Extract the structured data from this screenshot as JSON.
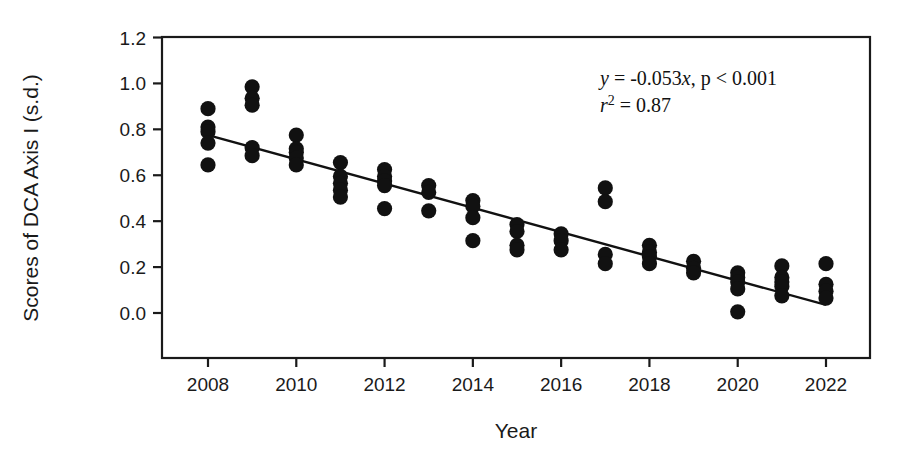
{
  "chart_data": {
    "type": "scatter",
    "title": "",
    "xlabel": "Year",
    "ylabel": "Scores of DCA Axis I (s.d.)",
    "xlim": [
      2007.0,
      2023.0
    ],
    "ylim": [
      -0.1,
      1.25
    ],
    "xticks": [
      2008,
      2010,
      2012,
      2014,
      2016,
      2018,
      2020,
      2022
    ],
    "xtick_labels": [
      "2008",
      "2010",
      "2012",
      "2014",
      "2016",
      "2018",
      "2020",
      "2022"
    ],
    "yticks": [
      0.0,
      0.2,
      0.4,
      0.6,
      0.8,
      1.0,
      1.2
    ],
    "ytick_labels": [
      "0.0",
      "0.2",
      "0.4",
      "0.6",
      "0.8",
      "1.0",
      "1.2"
    ],
    "grid": false,
    "legend": "none",
    "marker": "filled-circle",
    "marker_color": "#111111",
    "points": [
      {
        "x": 2008,
        "y": 0.89
      },
      {
        "x": 2008,
        "y": 0.81
      },
      {
        "x": 2008,
        "y": 0.79
      },
      {
        "x": 2008,
        "y": 0.74
      },
      {
        "x": 2008,
        "y": 0.645
      },
      {
        "x": 2009,
        "y": 0.985
      },
      {
        "x": 2009,
        "y": 0.935
      },
      {
        "x": 2009,
        "y": 0.905
      },
      {
        "x": 2009,
        "y": 0.72
      },
      {
        "x": 2009,
        "y": 0.685
      },
      {
        "x": 2010,
        "y": 0.775
      },
      {
        "x": 2010,
        "y": 0.715
      },
      {
        "x": 2010,
        "y": 0.7
      },
      {
        "x": 2010,
        "y": 0.675
      },
      {
        "x": 2010,
        "y": 0.645
      },
      {
        "x": 2011,
        "y": 0.655
      },
      {
        "x": 2011,
        "y": 0.595
      },
      {
        "x": 2011,
        "y": 0.565
      },
      {
        "x": 2011,
        "y": 0.535
      },
      {
        "x": 2011,
        "y": 0.505
      },
      {
        "x": 2012,
        "y": 0.625
      },
      {
        "x": 2012,
        "y": 0.595
      },
      {
        "x": 2012,
        "y": 0.575
      },
      {
        "x": 2012,
        "y": 0.555
      },
      {
        "x": 2012,
        "y": 0.455
      },
      {
        "x": 2013,
        "y": 0.555
      },
      {
        "x": 2013,
        "y": 0.525
      },
      {
        "x": 2013,
        "y": 0.445
      },
      {
        "x": 2014,
        "y": 0.49
      },
      {
        "x": 2014,
        "y": 0.465
      },
      {
        "x": 2014,
        "y": 0.415
      },
      {
        "x": 2014,
        "y": 0.315
      },
      {
        "x": 2015,
        "y": 0.385
      },
      {
        "x": 2015,
        "y": 0.355
      },
      {
        "x": 2015,
        "y": 0.295
      },
      {
        "x": 2015,
        "y": 0.275
      },
      {
        "x": 2016,
        "y": 0.345
      },
      {
        "x": 2016,
        "y": 0.315
      },
      {
        "x": 2016,
        "y": 0.275
      },
      {
        "x": 2017,
        "y": 0.545
      },
      {
        "x": 2017,
        "y": 0.485
      },
      {
        "x": 2017,
        "y": 0.255
      },
      {
        "x": 2017,
        "y": 0.215
      },
      {
        "x": 2018,
        "y": 0.295
      },
      {
        "x": 2018,
        "y": 0.265
      },
      {
        "x": 2018,
        "y": 0.245
      },
      {
        "x": 2018,
        "y": 0.215
      },
      {
        "x": 2019,
        "y": 0.225
      },
      {
        "x": 2019,
        "y": 0.195
      },
      {
        "x": 2019,
        "y": 0.175
      },
      {
        "x": 2020,
        "y": 0.175
      },
      {
        "x": 2020,
        "y": 0.155
      },
      {
        "x": 2020,
        "y": 0.135
      },
      {
        "x": 2020,
        "y": 0.105
      },
      {
        "x": 2020,
        "y": 0.005
      },
      {
        "x": 2021,
        "y": 0.205
      },
      {
        "x": 2021,
        "y": 0.155
      },
      {
        "x": 2021,
        "y": 0.135
      },
      {
        "x": 2021,
        "y": 0.115
      },
      {
        "x": 2021,
        "y": 0.075
      },
      {
        "x": 2022,
        "y": 0.215
      },
      {
        "x": 2022,
        "y": 0.125
      },
      {
        "x": 2022,
        "y": 0.095
      },
      {
        "x": 2022,
        "y": 0.065
      }
    ],
    "trendline": {
      "slope": -0.053,
      "x_start": 2008,
      "y_start": 0.775,
      "x_end": 2022,
      "y_end": 0.035
    },
    "annotations": {
      "equation_y": "y",
      "equation_rest": " = -0.053",
      "equation_x": "x",
      "equation_p": ", p < 0.001",
      "r2_symbol": "r",
      "r2_exponent": "2",
      "r2_value": " = 0.87"
    }
  }
}
